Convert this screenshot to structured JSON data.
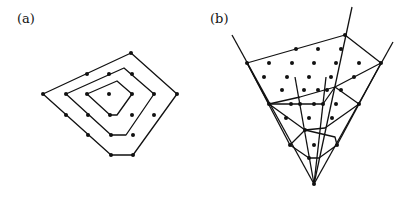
{
  "panels": [
    {
      "label": "(a)",
      "label_pos": [
        17,
        11
      ],
      "polygons": [
        [
          [
            43,
            94
          ],
          [
            131,
            53
          ],
          [
            177,
            94
          ],
          [
            133,
            155
          ],
          [
            111,
            155
          ]
        ],
        [
          [
            66,
            94
          ],
          [
            124,
            68
          ],
          [
            154,
            94
          ],
          [
            126,
            135
          ],
          [
            111,
            135
          ]
        ],
        [
          [
            87,
            94
          ],
          [
            117,
            81
          ],
          [
            132,
            94
          ],
          [
            117,
            115
          ],
          [
            110,
            115
          ]
        ]
      ],
      "dots": [
        [
          43,
          94
        ],
        [
          131,
          53
        ],
        [
          177,
          94
        ],
        [
          133,
          155
        ],
        [
          111,
          155
        ],
        [
          87,
          74
        ],
        [
          66,
          115
        ],
        [
          88,
          135
        ],
        [
          66,
          94
        ],
        [
          154,
          94
        ],
        [
          111,
          135
        ],
        [
          109,
          74
        ],
        [
          132,
          74
        ],
        [
          88,
          115
        ],
        [
          87,
          94
        ],
        [
          132,
          94
        ],
        [
          110,
          115
        ],
        [
          109,
          94
        ],
        [
          132,
          115
        ],
        [
          154,
          115
        ],
        [
          133,
          135
        ]
      ]
    },
    {
      "label": "(b)",
      "label_pos": [
        210,
        11
      ],
      "lines": [
        [
          [
            232,
            35
          ],
          [
            314,
            184
          ]
        ],
        [
          [
            352,
            7
          ],
          [
            314,
            184
          ]
        ],
        [
          [
            393,
            42
          ],
          [
            314,
            184
          ]
        ],
        [
          [
            295,
            77
          ],
          [
            314,
            184
          ]
        ],
        [
          [
            326,
            77
          ],
          [
            314,
            184
          ]
        ],
        [
          [
            247,
            63
          ],
          [
            345,
            35
          ],
          [
            381,
            63
          ]
        ],
        [
          [
            247,
            63
          ],
          [
            269,
            104
          ],
          [
            305,
            130
          ],
          [
            325,
            128
          ],
          [
            359,
            104
          ]
        ],
        [
          [
            381,
            63
          ],
          [
            335,
            87
          ],
          [
            300,
            97
          ],
          [
            269,
            104
          ]
        ],
        [
          [
            269,
            104
          ],
          [
            300,
            104
          ],
          [
            323,
            104
          ],
          [
            335,
            87
          ],
          [
            359,
            104
          ]
        ],
        [
          [
            290,
            145
          ],
          [
            305,
            130
          ],
          [
            335,
            137
          ],
          [
            337,
            145
          ]
        ],
        [
          [
            290,
            145
          ],
          [
            309,
            158
          ],
          [
            319,
            158
          ],
          [
            337,
            145
          ]
        ],
        [
          [
            247,
            63
          ],
          [
            290,
            145
          ]
        ],
        [
          [
            381,
            63
          ],
          [
            337,
            145
          ]
        ]
      ],
      "dots": [
        [
          247,
          63
        ],
        [
          345,
          35
        ],
        [
          381,
          63
        ],
        [
          296,
          49
        ],
        [
          318,
          49
        ],
        [
          341,
          49
        ],
        [
          269,
          63
        ],
        [
          292,
          63
        ],
        [
          314,
          63
        ],
        [
          336,
          63
        ],
        [
          359,
          63
        ],
        [
          264,
          77
        ],
        [
          287,
          77
        ],
        [
          309,
          77
        ],
        [
          331,
          77
        ],
        [
          354,
          77
        ],
        [
          282,
          90
        ],
        [
          304,
          90
        ],
        [
          318,
          90
        ],
        [
          327,
          90
        ],
        [
          341,
          90
        ],
        [
          269,
          104
        ],
        [
          291,
          104
        ],
        [
          300,
          104
        ],
        [
          314,
          104
        ],
        [
          323,
          104
        ],
        [
          336,
          104
        ],
        [
          359,
          104
        ],
        [
          286,
          118
        ],
        [
          309,
          118
        ],
        [
          332,
          118
        ],
        [
          305,
          130
        ],
        [
          290,
          145
        ],
        [
          314,
          145
        ],
        [
          337,
          145
        ],
        [
          309,
          158
        ],
        [
          314,
          184
        ]
      ]
    }
  ]
}
